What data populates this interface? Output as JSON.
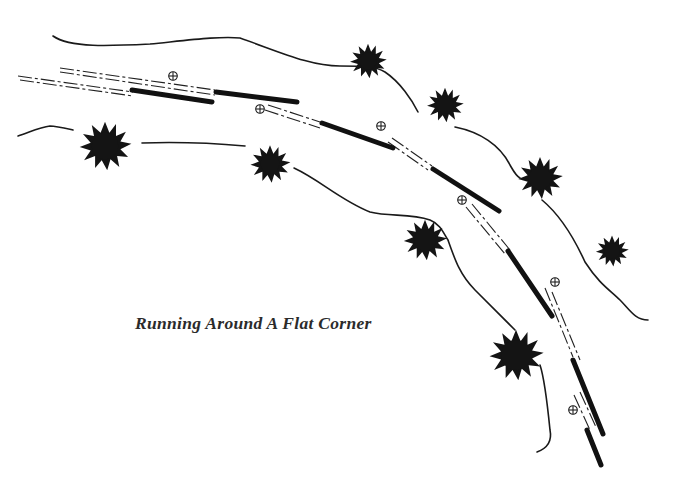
{
  "caption": "Running Around A Flat Corner",
  "colors": {
    "ink": "#141414",
    "background": "#ffffff",
    "caption": "#2b2b2b"
  },
  "diagram": {
    "type": "ski-technique-illustration",
    "elements": {
      "trail_banks": 2,
      "trees": 9,
      "ski_segments": 8,
      "pole_plants": 6
    }
  }
}
